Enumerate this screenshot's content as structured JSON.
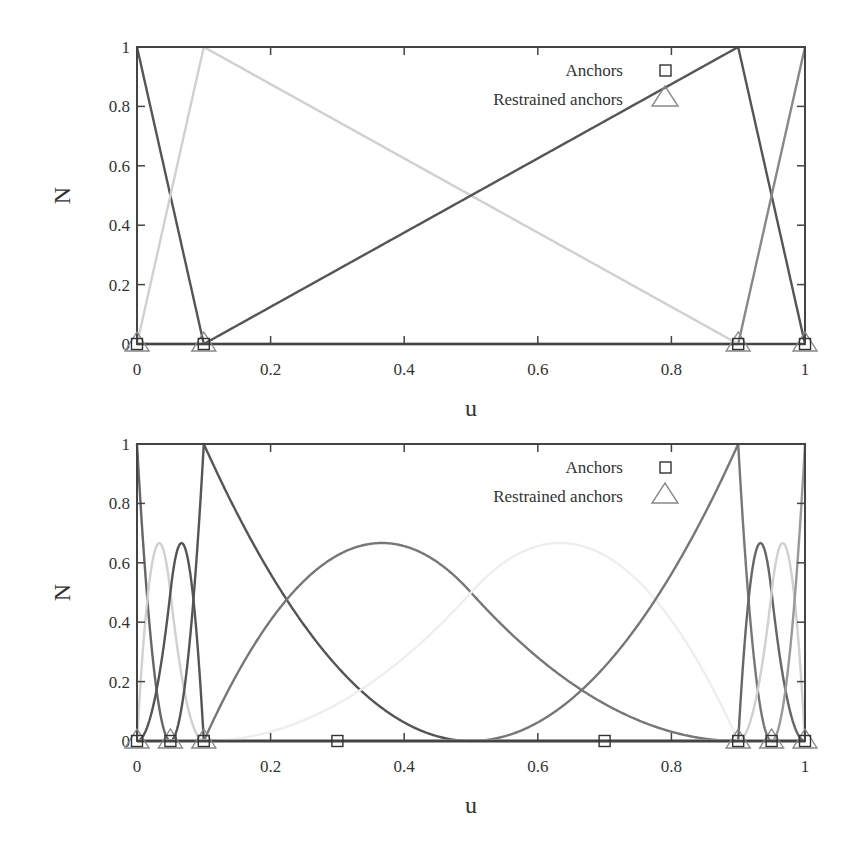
{
  "chart_data": [
    {
      "type": "line",
      "title": "",
      "xlabel": "u",
      "ylabel": "N",
      "xlim": [
        0,
        1
      ],
      "ylim": [
        0,
        1
      ],
      "x_ticks": [
        "0",
        "0.2",
        "0.4",
        "0.6",
        "0.8",
        "1"
      ],
      "y_ticks": [
        "0",
        "0.2",
        "0.4",
        "0.6",
        "0.8",
        "1"
      ],
      "grid": false,
      "legend": {
        "position": "top-right",
        "entries": [
          {
            "label": "Anchors",
            "marker": "square"
          },
          {
            "label": "Restrained anchors",
            "marker": "triangle"
          }
        ]
      },
      "basis": {
        "degree": 1,
        "knots": [
          0,
          0,
          0.1,
          0.9,
          1,
          1
        ]
      },
      "series": [
        {
          "name": "N1",
          "color": "#555555",
          "x": [
            0,
            0.1,
            1
          ],
          "values": [
            1,
            0,
            0
          ]
        },
        {
          "name": "N2",
          "color": "#d0d0d0",
          "x": [
            0,
            0.1,
            0.9,
            1
          ],
          "values": [
            0,
            1,
            0,
            0
          ]
        },
        {
          "name": "N3",
          "color": "#555555",
          "x": [
            0,
            0.1,
            0.9,
            1
          ],
          "values": [
            0,
            0,
            1,
            0
          ]
        },
        {
          "name": "N4",
          "color": "#888888",
          "x": [
            0,
            0.9,
            1
          ],
          "values": [
            0,
            0,
            1
          ]
        }
      ],
      "anchors": [
        0,
        0.1,
        0.9,
        1
      ],
      "restrained_anchors": [
        0,
        0.1,
        0.9,
        1
      ]
    },
    {
      "type": "line",
      "title": "",
      "xlabel": "u",
      "ylabel": "N",
      "xlim": [
        0,
        1
      ],
      "ylim": [
        0,
        1
      ],
      "x_ticks": [
        "0",
        "0.2",
        "0.4",
        "0.6",
        "0.8",
        "1"
      ],
      "y_ticks": [
        "0",
        "0.2",
        "0.4",
        "0.6",
        "0.8",
        "1"
      ],
      "grid": false,
      "legend": {
        "position": "top-right",
        "entries": [
          {
            "label": "Anchors",
            "marker": "square"
          },
          {
            "label": "Restrained anchors",
            "marker": "triangle"
          }
        ]
      },
      "basis": {
        "degree": 2,
        "knots": [
          0,
          0,
          0,
          0.05,
          0.1,
          0.1,
          0.5,
          0.9,
          0.9,
          0.95,
          1,
          1,
          1
        ]
      },
      "series": [
        {
          "name": "N1",
          "color": "#666666",
          "peak": 1,
          "peak_u": 0
        },
        {
          "name": "N2",
          "color": "#d0d0d0",
          "peak": 0.5,
          "peak_u": 0.05
        },
        {
          "name": "N3",
          "color": "#555555",
          "peak": 0.25,
          "peak_u": 0.075
        },
        {
          "name": "N4",
          "color": "#555555",
          "peak": 1,
          "peak_u": 0.1
        },
        {
          "name": "N5",
          "color": "#777777",
          "peak": 0.667,
          "peak_u": 0.37
        },
        {
          "name": "N6",
          "color": "#eeeeee",
          "peak": 0.667,
          "peak_u": 0.63
        },
        {
          "name": "N7",
          "color": "#777777",
          "peak": 1,
          "peak_u": 0.9
        },
        {
          "name": "N8",
          "color": "#666666",
          "peak": 0.25,
          "peak_u": 0.925
        },
        {
          "name": "N9",
          "color": "#d0d0d0",
          "peak": 0.5,
          "peak_u": 0.95
        },
        {
          "name": "N10",
          "color": "#999999",
          "peak": 1,
          "peak_u": 1
        }
      ],
      "anchors": [
        0,
        0.05,
        0.1,
        0.3,
        0.7,
        0.9,
        0.95,
        1
      ],
      "restrained_anchors": [
        0,
        0.05,
        0.1,
        0.9,
        0.95,
        1
      ]
    }
  ],
  "charts": [
    {
      "xlabel": "u",
      "ylabel": "N",
      "legend_anchors": "Anchors",
      "legend_restrained": "Restrained anchors",
      "x_ticks": [
        "0",
        "0.2",
        "0.4",
        "0.6",
        "0.8",
        "1"
      ],
      "y_ticks": [
        "0",
        "0.2",
        "0.4",
        "0.6",
        "0.8",
        "1"
      ]
    },
    {
      "xlabel": "u",
      "ylabel": "N",
      "legend_anchors": "Anchors",
      "legend_restrained": "Restrained anchors",
      "x_ticks": [
        "0",
        "0.2",
        "0.4",
        "0.6",
        "0.8",
        "1"
      ],
      "y_ticks": [
        "0",
        "0.2",
        "0.4",
        "0.6",
        "0.8",
        "1"
      ]
    }
  ]
}
